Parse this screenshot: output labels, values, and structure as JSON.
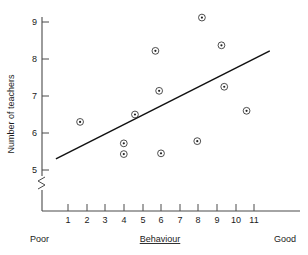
{
  "chart_data": {
    "type": "scatter",
    "title": "",
    "xlabel": "Behaviour",
    "ylabel": "Number of teachers",
    "xlim": [
      0.3,
      11.9
    ],
    "ylim": [
      4.6,
      9.35
    ],
    "grid": false,
    "legend": null,
    "x_ticks": [
      1,
      2,
      3,
      4,
      5,
      6,
      7,
      8,
      9,
      10,
      11
    ],
    "y_ticks": [
      5,
      6,
      7,
      8,
      9
    ],
    "y_axis_break": true,
    "x_axis_low_anchor": "Poor",
    "x_axis_high_anchor": "Good",
    "points": [
      {
        "x": 1.65,
        "y": 6.3
      },
      {
        "x": 4.0,
        "y": 5.72
      },
      {
        "x": 4.0,
        "y": 5.43
      },
      {
        "x": 4.6,
        "y": 6.5
      },
      {
        "x": 5.7,
        "y": 8.22
      },
      {
        "x": 5.9,
        "y": 7.14
      },
      {
        "x": 6.0,
        "y": 5.45
      },
      {
        "x": 7.95,
        "y": 5.78
      },
      {
        "x": 8.2,
        "y": 9.12
      },
      {
        "x": 9.25,
        "y": 8.37
      },
      {
        "x": 9.4,
        "y": 7.25
      },
      {
        "x": 10.6,
        "y": 6.6
      }
    ],
    "fit_line": {
      "x_start": 0.35,
      "y_start": 5.3,
      "x_end": 11.85,
      "y_end": 8.22
    },
    "colors": {
      "axis": "#4a4a4a",
      "marker": "#3a3a3a",
      "fit_line": "#111111",
      "text": "#1a1a1a",
      "background": "#ffffff"
    }
  },
  "labels": {
    "y_axis_title": "Number of teachers",
    "x_axis_title": "Behaviour",
    "poor": "Poor",
    "good": "Good",
    "y_5": "5",
    "y_6": "6",
    "y_7": "7",
    "y_8": "8",
    "y_9": "9",
    "x_1": "1",
    "x_2": "2",
    "x_3": "3",
    "x_4": "4",
    "x_5": "5",
    "x_6": "6",
    "x_7": "7",
    "x_8": "8",
    "x_9": "9",
    "x_10": "10",
    "x_11": "11"
  }
}
